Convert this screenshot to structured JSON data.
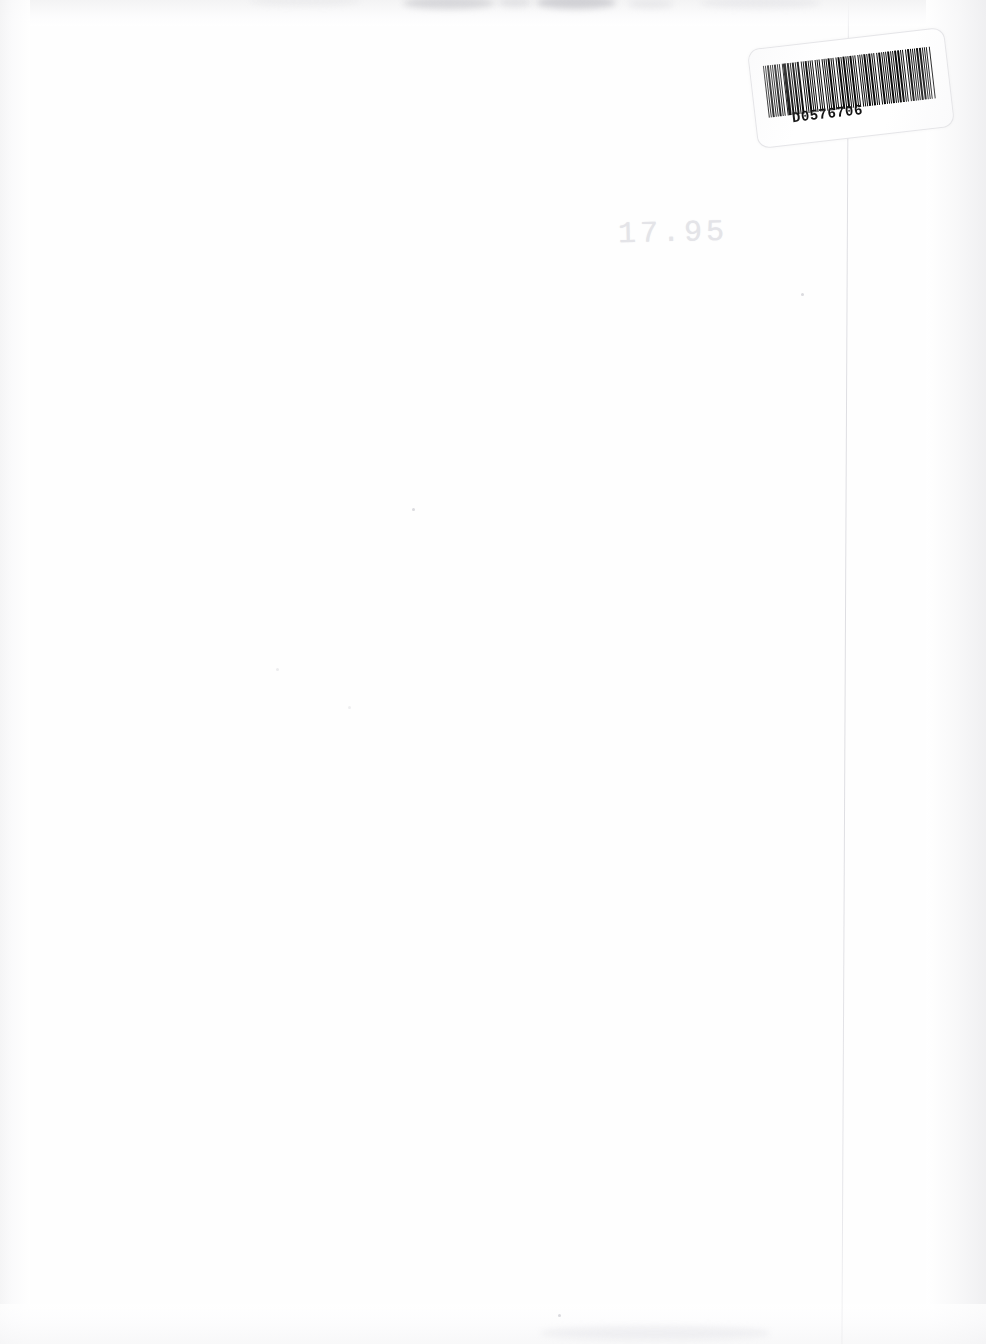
{
  "page": {
    "kind": "scanned-book-page",
    "width": 986,
    "height": 1344,
    "background_color": "#ffffff"
  },
  "barcode_sticker": {
    "label_name": "barcode-label",
    "human_readable_text": "D0576706",
    "rotation_degrees": -6.6,
    "bar_color": "#0a0a0a",
    "sticker_color": "#ffffff",
    "bar_pattern": [
      3,
      2,
      2,
      2,
      3,
      2,
      2,
      3,
      2,
      2,
      4,
      2,
      2,
      2,
      3,
      3,
      2,
      2,
      6,
      2,
      3,
      2,
      2,
      3,
      5,
      2,
      2,
      2,
      4,
      3,
      2,
      2,
      3,
      2,
      4,
      2,
      2,
      3,
      2,
      2,
      3,
      3,
      2,
      2,
      2,
      3,
      2,
      4,
      2,
      2,
      3,
      2,
      2,
      2,
      4,
      2,
      3,
      2,
      2,
      3,
      2,
      2,
      5,
      2,
      2,
      3,
      3,
      2,
      2,
      2,
      3,
      2,
      4,
      2,
      2,
      2,
      3,
      3,
      2,
      2,
      2,
      4,
      2,
      2,
      3,
      2,
      2,
      2,
      5,
      3,
      2,
      2,
      2,
      3,
      2,
      2,
      4,
      2,
      2,
      3,
      3,
      2,
      2,
      2,
      4,
      2,
      2,
      3,
      2,
      2,
      3,
      2,
      5,
      2,
      2,
      2,
      3,
      3,
      2,
      2,
      4,
      2,
      2,
      3,
      2,
      2,
      2,
      3,
      3,
      2,
      5,
      2,
      2,
      2,
      3,
      2,
      2,
      4,
      2,
      2
    ]
  },
  "price_mark": {
    "label_name": "price-marking",
    "text": "17.95",
    "color": "#e4e4e8",
    "note": "very faint pencil / stamp marking near top centre"
  },
  "artifacts": {
    "fold_line": {
      "label_name": "vertical-fold-line",
      "color": "#c6c6cd",
      "x_position": 848
    },
    "top_smudges_color": "#b2b2b8",
    "edge_shading_color": "#f1f1f2"
  }
}
